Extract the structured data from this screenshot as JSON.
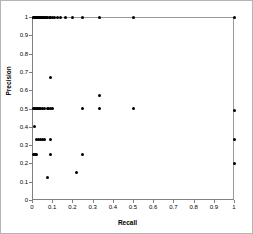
{
  "chart_data": {
    "type": "scatter",
    "title": "",
    "xlabel": "Recall",
    "ylabel": "Precision",
    "xlim": [
      0,
      1
    ],
    "ylim": [
      0,
      1
    ],
    "xticks": [
      "0",
      "0.1",
      "0.2",
      "0.3",
      "0.4",
      "0.5",
      "0.6",
      "0.7",
      "0.8",
      "0.9",
      "1"
    ],
    "xtick_values": [
      0,
      0.1,
      0.2,
      0.3,
      0.4,
      0.5,
      0.6,
      0.7,
      0.8,
      0.9,
      1
    ],
    "yticks": [
      "0",
      "0.1",
      "0.2",
      "0.3",
      "0.4",
      "0.5",
      "0.6",
      "0.7",
      "0.8",
      "0.9",
      "1"
    ],
    "ytick_values": [
      0,
      0.1,
      0.2,
      0.3,
      0.4,
      0.5,
      0.6,
      0.7,
      0.8,
      0.9,
      1
    ],
    "grid": false,
    "legend": false,
    "marker": "filled-circle",
    "marker_color": "#000000",
    "points": [
      [
        0.005,
        1
      ],
      [
        0.008,
        1
      ],
      [
        0.01,
        1
      ],
      [
        0.012,
        1
      ],
      [
        0.015,
        1
      ],
      [
        0.018,
        1
      ],
      [
        0.02,
        1
      ],
      [
        0.022,
        1
      ],
      [
        0.025,
        1
      ],
      [
        0.028,
        1
      ],
      [
        0.03,
        1
      ],
      [
        0.033,
        1
      ],
      [
        0.036,
        1
      ],
      [
        0.04,
        1
      ],
      [
        0.044,
        1
      ],
      [
        0.048,
        1
      ],
      [
        0.052,
        1
      ],
      [
        0.056,
        1
      ],
      [
        0.06,
        1
      ],
      [
        0.065,
        1
      ],
      [
        0.07,
        1
      ],
      [
        0.077,
        1
      ],
      [
        0.085,
        1
      ],
      [
        0.091,
        1
      ],
      [
        0.1,
        1
      ],
      [
        0.111,
        1
      ],
      [
        0.125,
        1
      ],
      [
        0.143,
        1
      ],
      [
        0.167,
        1
      ],
      [
        0.2,
        1
      ],
      [
        0.25,
        1
      ],
      [
        0.333,
        1
      ],
      [
        0.5,
        1
      ],
      [
        1.0,
        1
      ],
      [
        0.091,
        0.667
      ],
      [
        0.333,
        0.571
      ],
      [
        0.008,
        0.5
      ],
      [
        0.012,
        0.5
      ],
      [
        0.016,
        0.5
      ],
      [
        0.02,
        0.5
      ],
      [
        0.025,
        0.5
      ],
      [
        0.03,
        0.5
      ],
      [
        0.036,
        0.5
      ],
      [
        0.043,
        0.5
      ],
      [
        0.05,
        0.5
      ],
      [
        0.063,
        0.5
      ],
      [
        0.077,
        0.5
      ],
      [
        0.083,
        0.5
      ],
      [
        0.091,
        0.5
      ],
      [
        0.1,
        0.5
      ],
      [
        0.25,
        0.5
      ],
      [
        0.333,
        0.5
      ],
      [
        0.5,
        0.5
      ],
      [
        1.0,
        0.49
      ],
      [
        0.01,
        0.4
      ],
      [
        0.02,
        0.333
      ],
      [
        0.03,
        0.333
      ],
      [
        0.04,
        0.333
      ],
      [
        0.05,
        0.333
      ],
      [
        0.063,
        0.333
      ],
      [
        0.091,
        0.333
      ],
      [
        1.0,
        0.333
      ],
      [
        0.008,
        0.25
      ],
      [
        0.012,
        0.25
      ],
      [
        0.016,
        0.25
      ],
      [
        0.02,
        0.25
      ],
      [
        0.091,
        0.25
      ],
      [
        0.25,
        0.25
      ],
      [
        1.0,
        0.2
      ],
      [
        0.222,
        0.15
      ],
      [
        0.077,
        0.125
      ]
    ]
  }
}
